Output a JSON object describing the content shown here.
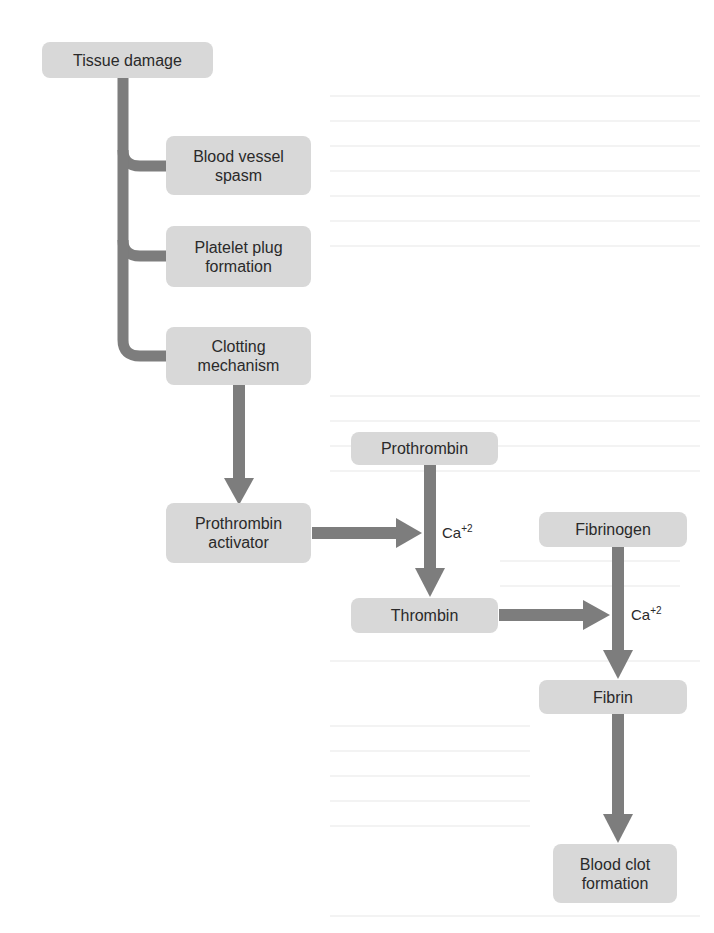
{
  "diagram": {
    "colors": {
      "node_fill": "#d8d8d8",
      "connector": "#7d7d7d",
      "text": "#2a2a2a",
      "background": "#ffffff"
    },
    "nodes": {
      "tissue_damage": "Tissue damage",
      "blood_vessel_spasm": "Blood vessel\nspasm",
      "platelet_plug": "Platelet plug\nformation",
      "clotting_mechanism": "Clotting\nmechanism",
      "prothrombin_activator": "Prothrombin\nactivator",
      "prothrombin": "Prothrombin",
      "thrombin": "Thrombin",
      "fibrinogen": "Fibrinogen",
      "fibrin": "Fibrin",
      "blood_clot": "Blood clot\nformation"
    },
    "cofactors": {
      "ca1_base": "Ca",
      "ca1_sup": "+2",
      "ca2_base": "Ca",
      "ca2_sup": "+2"
    },
    "edges": [
      {
        "from": "Tissue damage",
        "to": "Blood vessel spasm"
      },
      {
        "from": "Tissue damage",
        "to": "Platelet plug formation"
      },
      {
        "from": "Tissue damage",
        "to": "Clotting mechanism"
      },
      {
        "from": "Clotting mechanism",
        "to": "Prothrombin activator"
      },
      {
        "from": "Prothrombin activator",
        "to": "Prothrombin→Thrombin",
        "cofactor": "Ca+2"
      },
      {
        "from": "Prothrombin",
        "to": "Thrombin",
        "cofactor": "Ca+2"
      },
      {
        "from": "Thrombin",
        "to": "Fibrinogen→Fibrin",
        "cofactor": "Ca+2"
      },
      {
        "from": "Fibrinogen",
        "to": "Fibrin",
        "cofactor": "Ca+2"
      },
      {
        "from": "Fibrin",
        "to": "Blood clot formation"
      }
    ]
  }
}
